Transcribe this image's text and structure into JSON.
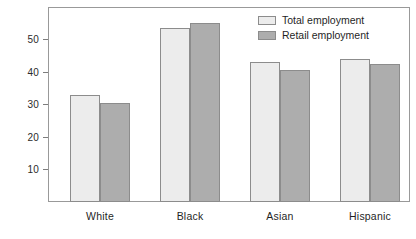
{
  "chart_data": {
    "type": "bar",
    "title": "",
    "subtitle": "",
    "xlabel": "",
    "ylabel": "",
    "categories": [
      "White",
      "Black",
      "Asian",
      "Hispanic"
    ],
    "series": [
      {
        "name": "Total employment",
        "values": [
          33.0,
          53.5,
          43.0,
          44.0
        ],
        "color": "#ececec"
      },
      {
        "name": "Retail employment",
        "values": [
          30.5,
          55.0,
          40.5,
          42.5
        ],
        "color": "#adadad"
      }
    ],
    "ylim": [
      0,
      60
    ],
    "yticks": [
      10,
      20,
      30,
      40,
      50
    ],
    "ytick_labels": [
      "10",
      "20",
      "30",
      "40",
      "50"
    ],
    "grid": false,
    "legend_position": "top-right",
    "annotations": []
  },
  "legend": {
    "items": [
      {
        "label": "Total employment",
        "swatch": "legend-swatch-total"
      },
      {
        "label": "Retail employment",
        "swatch": "legend-swatch-retail"
      }
    ]
  },
  "axis": {
    "y_ticks": [
      "10",
      "20",
      "30",
      "40",
      "50"
    ],
    "x_categories": [
      "White",
      "Black",
      "Asian",
      "Hispanic"
    ]
  },
  "colors": {
    "total_employment": "#ececec",
    "retail_employment": "#adadad",
    "frame": "#999999",
    "bar_border": "#8c8c8c",
    "text": "#1f1f1f"
  }
}
